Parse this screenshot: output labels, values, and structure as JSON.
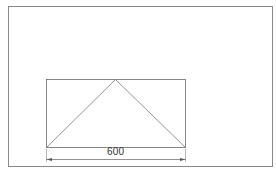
{
  "diagram": {
    "type": "technical-drawing",
    "frame": {
      "x": 8,
      "y": 6,
      "width": 264,
      "height": 160,
      "stroke": "#8a8a8a"
    },
    "rectangle": {
      "x": 46,
      "y": 79,
      "width": 139,
      "height": 68,
      "stroke": "#6a6a6a"
    },
    "triangle": {
      "points": [
        [
          46,
          147
        ],
        [
          115,
          79
        ],
        [
          185,
          147
        ]
      ],
      "stroke": "#7a7a7a"
    },
    "dimension": {
      "label": "600",
      "x1": 46,
      "x2": 185,
      "y": 159,
      "stroke": "#666666"
    }
  }
}
